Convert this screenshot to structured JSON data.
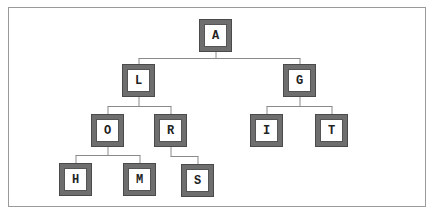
{
  "diagram": {
    "type": "tree",
    "colors": {
      "node_border": "#6e6e6e",
      "node_fill": "#ffffff",
      "edge": "#8a8a8a",
      "frame": "#9a9a9a"
    },
    "nodes": [
      {
        "id": "A",
        "label": "A",
        "x": 199,
        "y": 19
      },
      {
        "id": "L",
        "label": "L",
        "x": 122,
        "y": 64
      },
      {
        "id": "G",
        "label": "G",
        "x": 283,
        "y": 64
      },
      {
        "id": "O",
        "label": "O",
        "x": 91,
        "y": 114
      },
      {
        "id": "R",
        "label": "R",
        "x": 154,
        "y": 114
      },
      {
        "id": "I",
        "label": "I",
        "x": 250,
        "y": 114
      },
      {
        "id": "T",
        "label": "T",
        "x": 315,
        "y": 114
      },
      {
        "id": "H",
        "label": "H",
        "x": 59,
        "y": 163
      },
      {
        "id": "M",
        "label": "M",
        "x": 123,
        "y": 163
      },
      {
        "id": "S",
        "label": "S",
        "x": 181,
        "y": 164
      }
    ],
    "edges": [
      [
        "A",
        "L"
      ],
      [
        "A",
        "G"
      ],
      [
        "L",
        "O"
      ],
      [
        "L",
        "R"
      ],
      [
        "G",
        "I"
      ],
      [
        "G",
        "T"
      ],
      [
        "O",
        "H"
      ],
      [
        "O",
        "M"
      ],
      [
        "R",
        "S"
      ]
    ]
  }
}
